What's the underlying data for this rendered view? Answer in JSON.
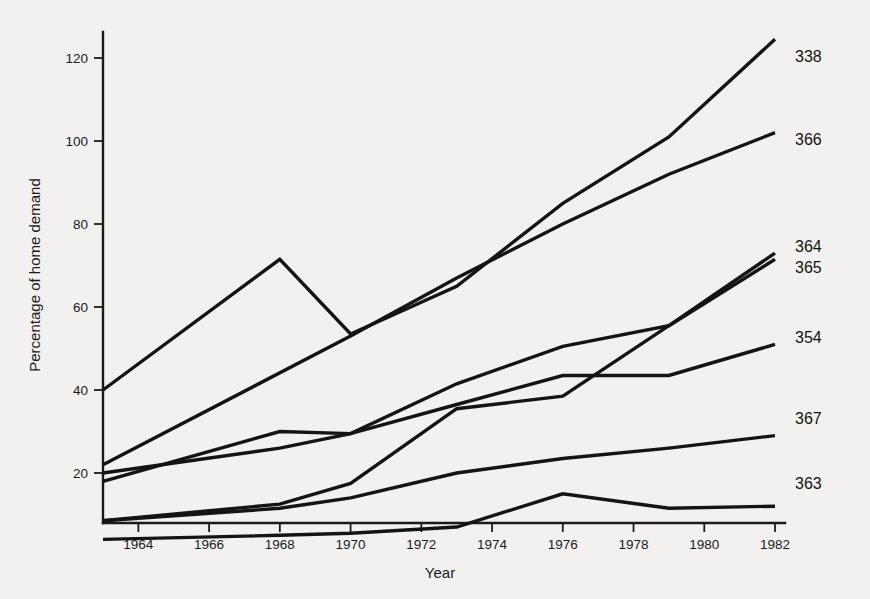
{
  "chart_data": {
    "type": "line",
    "title": "",
    "xlabel": "Year",
    "ylabel": "Percentage of home demand",
    "xlim": [
      1963,
      1982
    ],
    "ylim": [
      0,
      128
    ],
    "grid": false,
    "legend_position": "right-end-labels",
    "x_ticks": [
      1964,
      1966,
      1968,
      1970,
      1972,
      1974,
      1976,
      1978,
      1980,
      1982
    ],
    "x_tick_labels": [
      "1964",
      "1966",
      "1968",
      "1970",
      "1972",
      "1974",
      "1976",
      "1978",
      "1980",
      "1982"
    ],
    "y_ticks": [
      20,
      40,
      60,
      80,
      100,
      120
    ],
    "y_tick_labels": [
      "20",
      "40",
      "60",
      "80",
      "100",
      "120"
    ],
    "series": [
      {
        "name": "338",
        "label": "338",
        "x": [
          1963,
          1968,
          1970,
          1973,
          1976,
          1979,
          1982
        ],
        "values": [
          40,
          71.5,
          53.5,
          65,
          85,
          101,
          124.5
        ]
      },
      {
        "name": "366",
        "label": "366",
        "x": [
          1963,
          1970,
          1973,
          1976,
          1979,
          1982
        ],
        "values": [
          22,
          53,
          67,
          80,
          92,
          102
        ]
      },
      {
        "name": "364",
        "label": "364",
        "x": [
          1963,
          1968,
          1970,
          1973,
          1976,
          1979,
          1982
        ],
        "values": [
          20,
          26,
          29.5,
          41.5,
          50.5,
          55.5,
          73
        ]
      },
      {
        "name": "365",
        "label": "365",
        "x": [
          1963,
          1968,
          1970,
          1973,
          1976,
          1979,
          1982
        ],
        "values": [
          8.5,
          12.5,
          17.5,
          35.5,
          38.5,
          55.5,
          71.5
        ]
      },
      {
        "name": "354",
        "label": "354",
        "x": [
          1963,
          1968,
          1970,
          1973,
          1976,
          1979,
          1982
        ],
        "values": [
          18,
          30,
          29.5,
          36.5,
          43.5,
          43.5,
          51
        ]
      },
      {
        "name": "367",
        "label": "367",
        "x": [
          1963,
          1968,
          1970,
          1973,
          1976,
          1979,
          1982
        ],
        "values": [
          8.5,
          11.5,
          14,
          20,
          23.5,
          26,
          29
        ]
      },
      {
        "name": "363",
        "label": "363",
        "x": [
          1963,
          1968,
          1970,
          1973,
          1976,
          1979,
          1982
        ],
        "values": [
          4,
          5,
          5.5,
          7,
          15,
          11.5,
          12
        ]
      }
    ],
    "series_label_order": [
      "338",
      "366",
      "364",
      "365",
      "354",
      "367",
      "363"
    ]
  },
  "colors": {
    "background": "#f2f1ef",
    "ink": "#141414",
    "axis": "#1a1a1a"
  }
}
